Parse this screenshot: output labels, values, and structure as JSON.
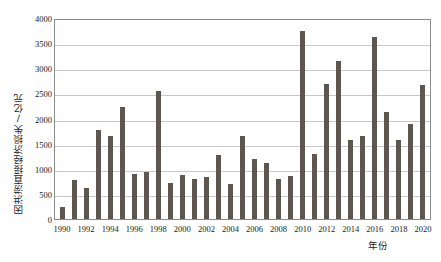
{
  "chart_data": {
    "type": "bar",
    "title": "",
    "xlabel": "年份",
    "ylabel": "因洪涝直接经济损失/亿元",
    "ylim": [
      0,
      4000
    ],
    "ytick_values": [
      0,
      500,
      1000,
      1500,
      2000,
      2500,
      3000,
      3500,
      4000
    ],
    "ytick_labels": [
      "0",
      "500",
      "1000",
      "1500",
      "2000",
      "2500",
      "3000",
      "3500",
      "4000"
    ],
    "grid": true,
    "legend": "none",
    "bar_color": "#5e574f",
    "gridline_color": "#c9c9c9",
    "frame_color": "#8c8c8c",
    "categories": [
      "1990",
      "1991",
      "1992",
      "1993",
      "1994",
      "1995",
      "1996",
      "1997",
      "1998",
      "1999",
      "2000",
      "2001",
      "2002",
      "2003",
      "2004",
      "2005",
      "2006",
      "2007",
      "2008",
      "2009",
      "2010",
      "2011",
      "2012",
      "2013",
      "2014",
      "2015",
      "2016",
      "2017",
      "2018",
      "2019",
      "2020"
    ],
    "xtick_labels": [
      "1990",
      "1992",
      "1994",
      "1996",
      "1998",
      "2000",
      "2002",
      "2004",
      "2006",
      "2008",
      "2010",
      "2012",
      "2014",
      "2016",
      "2018",
      "2020"
    ],
    "values": [
      240,
      780,
      610,
      1780,
      1660,
      2220,
      900,
      930,
      2540,
      720,
      880,
      790,
      830,
      1280,
      700,
      1660,
      1200,
      1120,
      790,
      850,
      3740,
      1300,
      2680,
      3150,
      1580,
      1660,
      3620,
      2130,
      1580,
      1900,
      2670
    ],
    "values_unit": "亿元"
  }
}
